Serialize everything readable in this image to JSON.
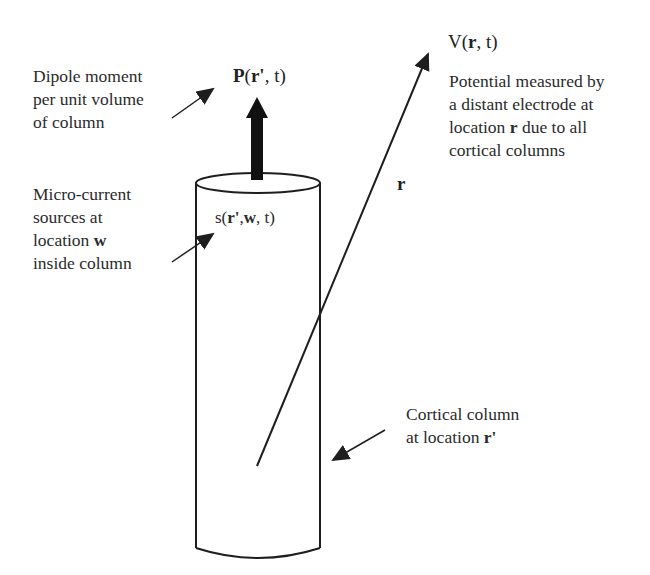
{
  "diagram": {
    "labels": {
      "dipole": {
        "lines": [
          "Dipole moment",
          "per unit volume",
          "of column"
        ]
      },
      "micro_current": {
        "line1": "Micro-current",
        "line2": "sources at",
        "line3_prefix": "location ",
        "line3_bold": "w",
        "line4": "inside column"
      },
      "potential": {
        "line1": "Potential measured by",
        "line2": "a distant electrode at",
        "line3_prefix": "location ",
        "line3_bold": "r",
        "line3_suffix": " due to all",
        "line4": "cortical columns"
      },
      "cortical_column": {
        "line1": "Cortical column",
        "line2_prefix": "at location ",
        "line2_bold": "r'"
      }
    },
    "math": {
      "dipole_symbol": {
        "func": "P",
        "open": "(",
        "arg_bold": "r'",
        "rest": ", t)"
      },
      "potential_symbol": {
        "func": "V(",
        "arg_bold": "r",
        "rest": ", t)"
      },
      "source_symbol": {
        "func": "s(",
        "arg1_bold": "r'",
        "sep": ",",
        "arg2_bold": "w",
        "rest": ", t)"
      },
      "position_vector": "r"
    },
    "colors": {
      "stroke": "#1e1e1e",
      "text": "#2b2b2b",
      "background": "#ffffff"
    }
  }
}
